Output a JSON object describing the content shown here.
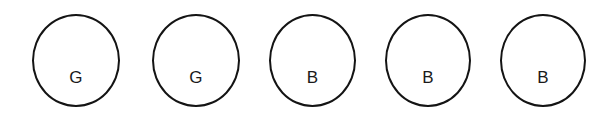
{
  "figure": {
    "type": "ball-sequence-diagram",
    "background_color": "#ffffff",
    "stroke_color": "#141414",
    "label_color": "#1a1a1a",
    "stroke_width_px": 2.6,
    "label_font_size_px": 17,
    "canvas": {
      "width": 615,
      "height": 115
    },
    "items": [
      {
        "label": "G",
        "name": "ball-1",
        "x": 32,
        "y": 14,
        "width": 88,
        "height": 93,
        "label_offset_y": 53
      },
      {
        "label": "G",
        "name": "ball-2",
        "x": 152,
        "y": 14,
        "width": 88,
        "height": 93,
        "label_offset_y": 53
      },
      {
        "label": "B",
        "name": "ball-3",
        "x": 269,
        "y": 14,
        "width": 87,
        "height": 93,
        "label_offset_y": 53
      },
      {
        "label": "B",
        "name": "ball-4",
        "x": 385,
        "y": 14,
        "width": 86,
        "height": 93,
        "label_offset_y": 53
      },
      {
        "label": "B",
        "name": "ball-5",
        "x": 500,
        "y": 14,
        "width": 86,
        "height": 93,
        "label_offset_y": 53
      }
    ]
  }
}
